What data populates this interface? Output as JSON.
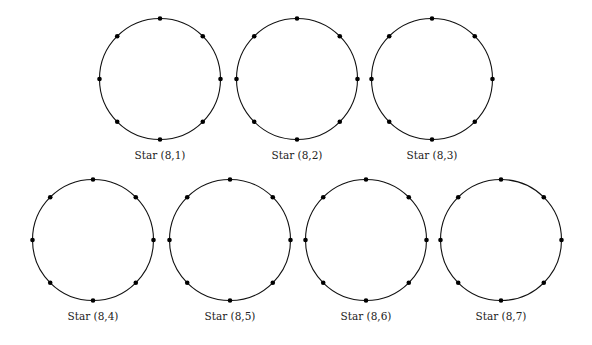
{
  "figure": {
    "stroke_color": "#111111",
    "vertex_color": "#000000",
    "radius": 60.5,
    "vertex_count": 8,
    "panels": [
      {
        "label": "Star (8,1)",
        "cx": 160,
        "cy": 79,
        "label_y": 159
      },
      {
        "label": "Star (8,2)",
        "cx": 297,
        "cy": 79,
        "label_y": 159
      },
      {
        "label": "Star (8,3)",
        "cx": 432,
        "cy": 79,
        "label_y": 159
      },
      {
        "label": "Star (8,4)",
        "cx": 93,
        "cy": 240,
        "label_y": 320
      },
      {
        "label": "Star (8,5)",
        "cx": 230,
        "cy": 240,
        "label_y": 320
      },
      {
        "label": "Star (8,6)",
        "cx": 366,
        "cy": 240,
        "label_y": 320
      },
      {
        "label": "Star (8,7)",
        "cx": 501,
        "cy": 240,
        "label_y": 320
      }
    ]
  }
}
